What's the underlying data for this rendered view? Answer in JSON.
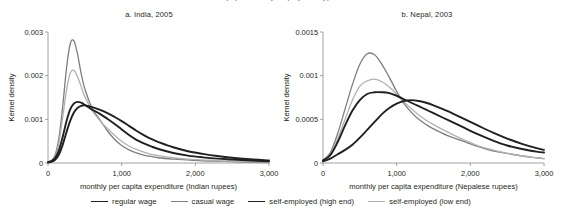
{
  "figure": {
    "cut_off_header": "population, by employment type",
    "legend": [
      {
        "label": "regular wage",
        "color": "#231f20",
        "width": 1.9
      },
      {
        "label": "casual wage",
        "color": "#7d7e80",
        "width": 1.3
      },
      {
        "label": "self-employed (high end)",
        "color": "#231f20",
        "width": 1.9
      },
      {
        "label": "self-employed (low end)",
        "color": "#b0b1b3",
        "width": 1.3
      }
    ]
  },
  "chart_data": [
    {
      "id": "india",
      "type": "line",
      "title": "a. India, 2005",
      "xlabel": "monthly per capita expenditure (Indian rupees)",
      "ylabel": "Kernel density",
      "xlim": [
        0,
        3000
      ],
      "ylim": [
        0,
        0.003
      ],
      "xticks": [
        0,
        1000,
        2000,
        3000
      ],
      "xticklabels": [
        "0",
        "1,000",
        "2,000",
        "3,000"
      ],
      "yticks": [
        0,
        0.001,
        0.002,
        0.003
      ],
      "yticklabels": [
        "0",
        "0.001",
        "0.002",
        "0.003"
      ],
      "grid": false,
      "legend_position": "below-figure",
      "x": [
        0,
        50,
        100,
        150,
        200,
        250,
        300,
        350,
        400,
        450,
        500,
        600,
        700,
        800,
        900,
        1000,
        1100,
        1200,
        1300,
        1400,
        1500,
        1700,
        1900,
        2100,
        2300,
        2500,
        2700,
        3000
      ],
      "series": [
        {
          "name": "casual wage",
          "color": "#7d7e80",
          "width": 1.3,
          "values": [
            2e-05,
            6e-05,
            0.0002,
            0.0006,
            0.0013,
            0.00215,
            0.00272,
            0.0028,
            0.0025,
            0.00205,
            0.0017,
            0.00125,
            0.001,
            0.00075,
            0.00055,
            0.0004,
            0.0003,
            0.00023,
            0.00018,
            0.00015,
            0.00012,
            9e-05,
            7e-05,
            5e-05,
            4e-05,
            3e-05,
            2e-05,
            1e-05
          ]
        },
        {
          "name": "self-employed (low end)",
          "color": "#b0b1b3",
          "width": 1.3,
          "values": [
            2e-05,
            5e-05,
            0.00016,
            0.00048,
            0.00105,
            0.00165,
            0.00205,
            0.00212,
            0.00198,
            0.00175,
            0.00152,
            0.0012,
            0.00098,
            0.0008,
            0.00064,
            0.0005,
            0.00039,
            0.00031,
            0.00025,
            0.0002,
            0.00017,
            0.00012,
            9e-05,
            7e-05,
            5e-05,
            4e-05,
            3e-05,
            2e-05
          ]
        },
        {
          "name": "self-employed (high end)",
          "color": "#231f20",
          "width": 1.9,
          "values": [
            2e-05,
            5e-05,
            0.00012,
            0.0003,
            0.0006,
            0.00095,
            0.00122,
            0.00136,
            0.0014,
            0.00138,
            0.00133,
            0.00122,
            0.00113,
            0.00102,
            0.0009,
            0.00077,
            0.00064,
            0.00053,
            0.00045,
            0.00038,
            0.00032,
            0.00023,
            0.00017,
            0.00013,
            0.0001,
            8e-05,
            6e-05,
            4e-05
          ]
        },
        {
          "name": "regular wage",
          "color": "#231f20",
          "width": 1.9,
          "values": [
            1e-05,
            3e-05,
            8e-05,
            0.0002,
            0.00042,
            0.0007,
            0.00096,
            0.00115,
            0.00126,
            0.00131,
            0.00132,
            0.00128,
            0.00122,
            0.00115,
            0.00106,
            0.00096,
            0.00085,
            0.00074,
            0.00064,
            0.00055,
            0.00048,
            0.00036,
            0.00027,
            0.00021,
            0.00016,
            0.00012,
            9e-05,
            6e-05
          ]
        }
      ]
    },
    {
      "id": "nepal",
      "type": "line",
      "title": "b. Nepal, 2003",
      "xlabel": "monthly per capita expenditure (Nepalese rupees)",
      "ylabel": "Kernel density",
      "xlim": [
        0,
        3000
      ],
      "ylim": [
        0,
        0.0015
      ],
      "xticks": [
        0,
        1000,
        2000,
        3000
      ],
      "xticklabels": [
        "0",
        "1,000",
        "2,000",
        "3,000"
      ],
      "yticks": [
        0,
        0.0005,
        0.001,
        0.0015
      ],
      "yticklabels": [
        "0",
        "0.0005",
        "0.001",
        "0.0015"
      ],
      "grid": false,
      "legend_position": "below-figure",
      "x": [
        0,
        100,
        200,
        300,
        400,
        500,
        600,
        700,
        800,
        900,
        1000,
        1100,
        1200,
        1300,
        1400,
        1500,
        1700,
        1900,
        2100,
        2300,
        2500,
        2700,
        2900,
        3000
      ],
      "series": [
        {
          "name": "casual wage",
          "color": "#7d7e80",
          "width": 1.3,
          "values": [
            3e-05,
            0.00012,
            0.00034,
            0.00062,
            0.0009,
            0.00113,
            0.00125,
            0.00124,
            0.00113,
            0.00098,
            0.00082,
            0.00068,
            0.00058,
            0.0005,
            0.00044,
            0.00039,
            0.00031,
            0.00025,
            0.00019,
            0.00014,
            0.00011,
            8e-05,
            6e-05,
            5e-05
          ]
        },
        {
          "name": "self-employed (low end)",
          "color": "#b0b1b3",
          "width": 1.3,
          "values": [
            3e-05,
            0.0001,
            0.00028,
            0.0005,
            0.00072,
            0.00088,
            0.00094,
            0.00096,
            0.00093,
            0.00087,
            0.00079,
            0.0007,
            0.00062,
            0.00055,
            0.00049,
            0.00044,
            0.00035,
            0.00027,
            0.0002,
            0.00015,
            0.00011,
            8e-05,
            6e-05,
            5e-05
          ]
        },
        {
          "name": "self-employed (high end)",
          "color": "#231f20",
          "width": 1.9,
          "values": [
            3e-05,
            9e-05,
            0.00024,
            0.00043,
            0.0006,
            0.00072,
            0.00079,
            0.00081,
            0.00081,
            0.0008,
            0.00077,
            0.00073,
            0.00069,
            0.00065,
            0.00061,
            0.00057,
            0.00049,
            0.00041,
            0.00033,
            0.00026,
            0.0002,
            0.00016,
            0.00013,
            0.00012
          ]
        },
        {
          "name": "regular wage",
          "color": "#231f20",
          "width": 1.9,
          "values": [
            2e-05,
            5e-05,
            0.0001,
            0.00015,
            0.00021,
            0.00029,
            0.00038,
            0.00047,
            0.00056,
            0.00063,
            0.00068,
            0.00071,
            0.00072,
            0.00071,
            0.00069,
            0.00066,
            0.00059,
            0.00051,
            0.00043,
            0.00035,
            0.00028,
            0.00022,
            0.00017,
            0.00015
          ]
        }
      ]
    }
  ]
}
